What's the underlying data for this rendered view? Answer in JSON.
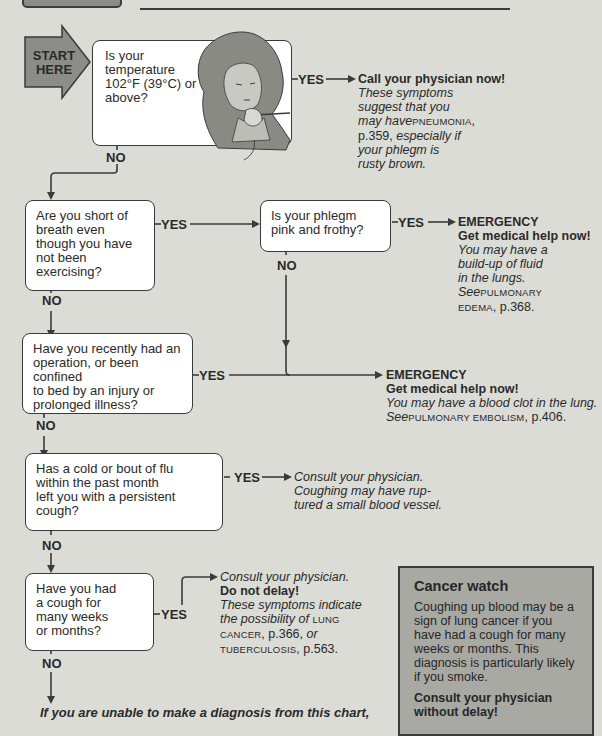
{
  "header": {
    "rule": true
  },
  "start": {
    "label_line1": "START",
    "label_line2": "HERE"
  },
  "questions": [
    {
      "id": "q1",
      "text": "Is your temperature 102°F (39°C) or above?",
      "lines": [
        "Is your",
        "temperature",
        "102°F (39°C) or",
        "above?"
      ]
    },
    {
      "id": "q2",
      "text": "Are you short of breath even though you have not been exercising?",
      "lines": [
        "Are you short of",
        "breath even",
        "though you have",
        "not been",
        "exercising?"
      ]
    },
    {
      "id": "q2b",
      "text": "Is your phlegm pink and frothy?",
      "lines": [
        "Is your phlegm",
        "pink and frothy?"
      ]
    },
    {
      "id": "q3",
      "text": "Have you recently had an operation, or been confined to bed by an injury or prolonged illness?",
      "lines": [
        "Have you recently had an",
        "operation, or been confined",
        "to bed by an injury or",
        "prolonged illness?"
      ]
    },
    {
      "id": "q4",
      "text": "Has a cold or bout of flu within the past month left you with a persistent cough?",
      "lines": [
        "Has a cold or bout of flu",
        "within the past month",
        "left you with a persistent",
        "cough?"
      ]
    },
    {
      "id": "q5",
      "text": "Have you had a cough for many weeks or months?",
      "lines": [
        "Have you had",
        "a cough for",
        "many weeks",
        "or months?"
      ]
    }
  ],
  "labels": {
    "yes": "YES",
    "no": "NO"
  },
  "answers": {
    "a1": {
      "heading": "Call your physician now!",
      "l1": "These symptoms",
      "l2": "suggest that you",
      "l3_pre": "may have",
      "l3_sc": "PNEUMONIA",
      "l3_post": ",",
      "l4_pre": "p.359, ",
      "l4_it": "especially if",
      "l5": "your phlegm is",
      "l6": "rusty brown."
    },
    "a2b": {
      "heading1": "EMERGENCY",
      "heading2": "Get medical help now!",
      "l1": "You may have a",
      "l2": "build-up of fluid",
      "l3": "in the lungs.",
      "l4_it": "See",
      "l4_sc": "PULMONARY",
      "l5_sc": "EDEMA",
      "l5_post": ", p.368."
    },
    "a3": {
      "heading1": "EMERGENCY",
      "heading2": "Get medical help now!",
      "l1": "You may have a blood clot in the lung.",
      "l2_it": "See",
      "l2_sc": "PULMONARY EMBOLISM",
      "l2_post": ", p.406."
    },
    "a4": {
      "l1": "Consult your physician.",
      "l2": "Coughing may have rup-",
      "l3": "tured a small blood vessel."
    },
    "a5": {
      "l1": "Consult your physician.",
      "heading": "Do not delay!",
      "l2": "These symptoms indicate",
      "l3_it": "the possibility of",
      "l3_sc": "LUNG",
      "l4_sc": "CANCER",
      "l4_post": ", p.366, ",
      "l4_it": "or",
      "l5_sc": "TUBERCULOSIS",
      "l5_post": ", p.563."
    }
  },
  "footer": {
    "text": "If you are unable to make a diagnosis from this chart,"
  },
  "cancer_watch": {
    "title": "Cancer watch",
    "body": "Coughing up blood may be a sign of lung cancer if you have had a cough for many weeks or months. This diagnosis is particularly likely if you smoke.",
    "cta": "Consult your physician without delay!"
  },
  "colors": {
    "background": "#dcdcd6",
    "box": "#ffffff",
    "line": "#3a3a3a",
    "start_arrow": "#8d8d88",
    "sidebar": "#a9a9a4"
  }
}
